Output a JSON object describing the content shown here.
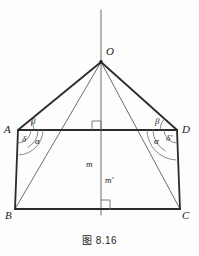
{
  "figure": {
    "caption": "图 8.16",
    "type": "geometry-diagram",
    "background_color": "#fdfdfd",
    "stroke_color": "#2b2b2b",
    "thin_stroke_color": "#6e6e6e",
    "vertices": [
      {
        "id": "O",
        "label": "O",
        "x": 101,
        "y": 62,
        "label_x": 106,
        "label_y": 52
      },
      {
        "id": "A",
        "label": "A",
        "x": 18,
        "y": 130,
        "label_x": 4,
        "label_y": 123
      },
      {
        "id": "D",
        "label": "D",
        "x": 177,
        "y": 130,
        "label_x": 182,
        "label_y": 123
      },
      {
        "id": "B",
        "label": "B",
        "x": 15,
        "y": 209,
        "label_x": 5,
        "label_y": 211
      },
      {
        "id": "C",
        "label": "C",
        "x": 180,
        "y": 209,
        "label_x": 182,
        "label_y": 211
      }
    ],
    "segments": [
      {
        "name": "axis-above-O",
        "from": [
          101,
          10
        ],
        "to": [
          101,
          62
        ],
        "weight": "thin"
      },
      {
        "name": "axis-O-to-base",
        "from": [
          101,
          62
        ],
        "to": [
          101,
          215
        ],
        "weight": "thin"
      },
      {
        "name": "O-to-A",
        "from": [
          101,
          62
        ],
        "to": [
          18,
          130
        ],
        "weight": "thick"
      },
      {
        "name": "O-to-D",
        "from": [
          101,
          62
        ],
        "to": [
          177,
          130
        ],
        "weight": "thick"
      },
      {
        "name": "O-to-B",
        "from": [
          101,
          62
        ],
        "to": [
          15,
          209
        ],
        "weight": "thin"
      },
      {
        "name": "O-to-C",
        "from": [
          101,
          62
        ],
        "to": [
          180,
          209
        ],
        "weight": "thin"
      },
      {
        "name": "A-to-D",
        "from": [
          18,
          130
        ],
        "to": [
          177,
          130
        ],
        "weight": "thick"
      },
      {
        "name": "A-to-B",
        "from": [
          18,
          130
        ],
        "to": [
          15,
          209
        ],
        "weight": "thick"
      },
      {
        "name": "D-to-C",
        "from": [
          177,
          130
        ],
        "to": [
          180,
          209
        ],
        "weight": "thick"
      },
      {
        "name": "B-to-C",
        "from": [
          15,
          209
        ],
        "to": [
          180,
          209
        ],
        "weight": "thick"
      }
    ],
    "angle_labels": [
      {
        "id": "beta-left",
        "label": "β",
        "x": 31,
        "y": 117
      },
      {
        "id": "delta-left",
        "label": "δ",
        "x": 22,
        "y": 135
      },
      {
        "id": "alpha-left",
        "label": "α",
        "x": 35,
        "y": 137
      },
      {
        "id": "beta-right",
        "label": "β",
        "x": 155,
        "y": 117
      },
      {
        "id": "alpha-right",
        "label": "α",
        "x": 154,
        "y": 137
      },
      {
        "id": "delta-right",
        "label": "δ′",
        "x": 166,
        "y": 134
      }
    ],
    "length_labels": [
      {
        "id": "m",
        "label": "m",
        "x": 86,
        "y": 160
      },
      {
        "id": "m-prime",
        "label": "m′",
        "x": 105,
        "y": 176
      }
    ],
    "right_angle_marks": [
      {
        "id": "top-right-angle",
        "x": 92,
        "y": 121,
        "size": 9,
        "orient": "above-left"
      },
      {
        "id": "bottom-right-angle",
        "x": 101,
        "y": 200,
        "size": 9,
        "orient": "above-right"
      }
    ],
    "angle_arcs": [
      {
        "id": "arc-beta-left",
        "cx": 18,
        "cy": 130,
        "r": 16,
        "a0": -39,
        "a1": 0
      },
      {
        "id": "arc-delta-left",
        "cx": 18,
        "cy": 130,
        "r": 13,
        "a0": 0,
        "a1": 88
      },
      {
        "id": "arc-alpha-left",
        "cx": 18,
        "cy": 130,
        "r": 20,
        "a0": 0,
        "a1": 60
      },
      {
        "id": "arc-outer-left",
        "cx": 18,
        "cy": 130,
        "r": 25,
        "a0": 0,
        "a1": 88
      },
      {
        "id": "arc-beta-right",
        "cx": 177,
        "cy": 130,
        "r": 17,
        "a0": 180,
        "a1": 221
      },
      {
        "id": "arc-alpha-right",
        "cx": 177,
        "cy": 130,
        "r": 24,
        "a0": 119,
        "a1": 180
      },
      {
        "id": "arc-delta-right",
        "cx": 177,
        "cy": 130,
        "r": 13,
        "a0": 92,
        "a1": 180
      },
      {
        "id": "arc-outer-right",
        "cx": 177,
        "cy": 130,
        "r": 30,
        "a0": 92,
        "a1": 180
      }
    ]
  }
}
